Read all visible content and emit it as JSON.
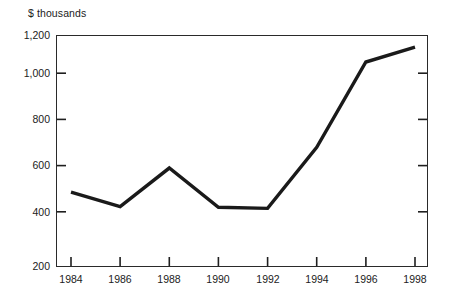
{
  "chart_data": {
    "type": "line",
    "title": "",
    "subtitle": "",
    "xlabel": "",
    "ylabel": "$ thousands",
    "categories": [
      "1984",
      "1986",
      "1988",
      "1990",
      "1992",
      "1994",
      "1996",
      "1998"
    ],
    "x": [
      1984,
      1986,
      1988,
      1990,
      1992,
      1994,
      1996,
      1998
    ],
    "values": [
      520,
      458,
      625,
      455,
      450,
      715,
      1085,
      1150
    ],
    "series": [
      {
        "name": "",
        "values": [
          520,
          458,
          625,
          455,
          450,
          715,
          1085,
          1150
        ]
      }
    ],
    "ylim": [
      200,
      1200
    ],
    "xlim": [
      1984,
      1998
    ],
    "yticks": [
      200,
      400,
      600,
      800,
      1000,
      1200
    ],
    "ytick_labels": [
      "200",
      "400",
      "600",
      "800",
      "1,000",
      "1,200"
    ],
    "xticks": [
      1984,
      1986,
      1988,
      1990,
      1992,
      1994,
      1996,
      1998
    ],
    "xtick_labels": [
      "1984",
      "1986",
      "1988",
      "1990",
      "1992",
      "1994",
      "1996",
      "1998"
    ],
    "grid": false,
    "legend": null,
    "legend_position": "none",
    "annotations": [],
    "line_color": "#1a1a1a",
    "background_color": "#ffffff",
    "axis_color": "#1a1a1a",
    "line_width": 3.4
  },
  "axis": {
    "y_title": "$ thousands"
  }
}
